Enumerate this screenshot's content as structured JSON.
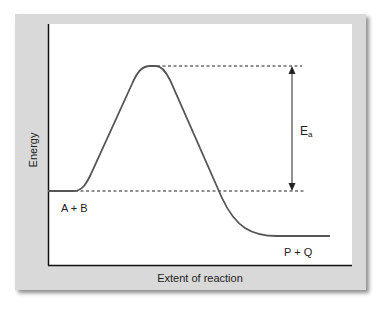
{
  "diagram": {
    "type": "reaction-energy-profile",
    "axes": {
      "ylabel": "Energy",
      "xlabel": "Extent of reaction"
    },
    "labels": {
      "reactants": "A + B",
      "products": "P + Q",
      "activation_energy_main": "E",
      "activation_energy_sub": "a"
    },
    "levels": {
      "reactant_level": "low-middle",
      "transition_state": "peak",
      "product_level": "lowest"
    },
    "colors": {
      "frame": "#d9d9d9",
      "plot_background": "#ffffff",
      "curve": "#555555",
      "axis": "#111111",
      "text": "#222222"
    }
  }
}
